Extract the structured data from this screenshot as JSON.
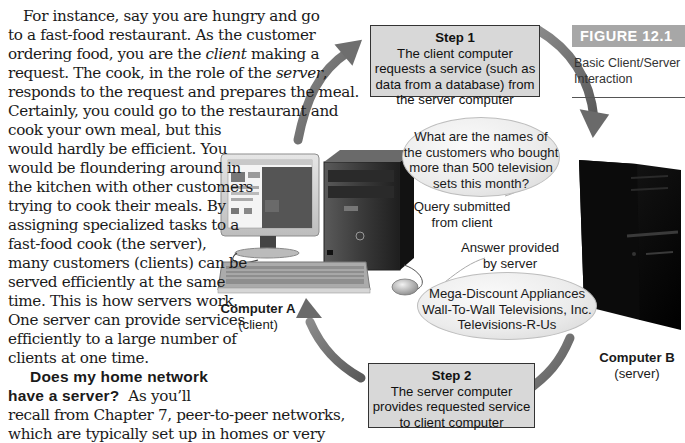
{
  "body_text": {
    "paragraph1": [
      {
        "text": "For instance, say you are hungry and go",
        "indent": true
      },
      {
        "text": "to a fast-food restaurant. As the customer"
      },
      {
        "pre": "ordering food, you are the ",
        "em": "client",
        "post": " making a"
      },
      {
        "pre": "request. The cook, in the role of the ",
        "em": "server",
        "post": ","
      },
      {
        "text": "responds to the request and prepares the meal."
      },
      {
        "text": "Certainly, you could go to the restaurant and"
      },
      {
        "text": "cook your own meal, but this"
      },
      {
        "text": "would hardly be efficient. You"
      },
      {
        "text": "would be floundering around in"
      },
      {
        "text": "the kitchen with other customers"
      },
      {
        "text": "trying to cook their meals. By"
      },
      {
        "text": "assigning specialized tasks to a"
      },
      {
        "text": "fast-food cook (the server),"
      },
      {
        "text": "many customers (clients) can be"
      },
      {
        "text": "served efficiently at the same"
      },
      {
        "text": "time. This is how servers work."
      },
      {
        "text": "One server can provide services"
      },
      {
        "text": "efficiently to a large number of"
      },
      {
        "text": "clients at one time."
      }
    ],
    "section_heading_line1": "Does my home network",
    "section_heading_line2": "have a server?",
    "paragraph2_first_line_rest": "As you’ll",
    "paragraph2": [
      {
        "text": "recall from Chapter 7, peer-to-peer networks,"
      },
      {
        "text": "which are typically set up in homes or very"
      },
      {
        "text": "small businesses, do not require servers. In"
      },
      {
        "text": "these networks, computers act as both clients"
      },
      {
        "text": "and servers when appropriate."
      }
    ]
  },
  "figure": {
    "tag": "FIGURE 12.1",
    "caption_line1": "Basic Client/Server",
    "caption_line2": "Interaction",
    "step1": {
      "title": "Step 1",
      "lines": [
        "The client computer",
        "requests a service (such as",
        "data from a database) from",
        "the server computer"
      ]
    },
    "step2": {
      "title": "Step 2",
      "lines": [
        "The server computer",
        "provides requested service",
        "to client computer"
      ]
    },
    "query_bubble": {
      "lines": [
        "What are the names of",
        "the customers who bought",
        "more than 500 television",
        "sets this month?"
      ]
    },
    "query_label": [
      "Query submitted",
      "from client"
    ],
    "answer_label": [
      "Answer provided",
      "by server"
    ],
    "answer_bubble": {
      "lines": [
        "Mega-Discount Appliances",
        "Wall-To-Wall Televisions, Inc.",
        "Televisions-R-Us"
      ]
    },
    "computer_a": {
      "name": "Computer A",
      "role": "(client)"
    },
    "computer_b": {
      "name": "Computer B",
      "role": "(server)"
    },
    "colors": {
      "arrow": "#6e6e6e",
      "step_box_fill": "#d8d8d8",
      "figure_tag_fill": "#a7a7a7",
      "server_tower": "#0d0d0d"
    }
  }
}
